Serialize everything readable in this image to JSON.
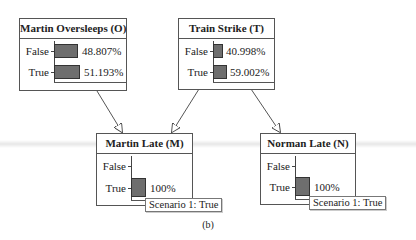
{
  "diagram": {
    "caption": "(b)",
    "nodes": [
      {
        "id": "O",
        "title": "Martin Oversleeps (O)",
        "states": [
          {
            "label": "False",
            "value": 48.807,
            "display": "48.807%"
          },
          {
            "label": "True",
            "value": 51.193,
            "display": "51.193%"
          }
        ]
      },
      {
        "id": "T",
        "title": "Train Strike (T)",
        "states": [
          {
            "label": "False",
            "value": 40.998,
            "display": "40.998%"
          },
          {
            "label": "True",
            "value": 59.002,
            "display": "59.002%"
          }
        ]
      },
      {
        "id": "M",
        "title": "Martin Late (M)",
        "states": [
          {
            "label": "False",
            "value": 0,
            "display": ""
          },
          {
            "label": "True",
            "value": 100,
            "display": "100%"
          }
        ],
        "scenario": "Scenario 1: True"
      },
      {
        "id": "N",
        "title": "Norman Late (N)",
        "states": [
          {
            "label": "False",
            "value": 0,
            "display": ""
          },
          {
            "label": "True",
            "value": 100,
            "display": "100%"
          }
        ],
        "scenario": "Scenario 1: True"
      }
    ],
    "edges": [
      {
        "from": "O",
        "to": "M"
      },
      {
        "from": "T",
        "to": "M"
      },
      {
        "from": "T",
        "to": "N"
      }
    ],
    "colors": {
      "bar_fill": "#6e6e6e",
      "border": "#555555"
    }
  }
}
